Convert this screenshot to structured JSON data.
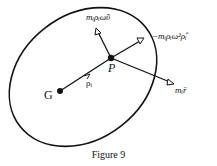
{
  "figure": {
    "caption": "Figure 9",
    "points": {
      "G": "G",
      "P": "P"
    },
    "vectors": {
      "rho": "ρᵢ",
      "tangential": "mᵢρᵢω̇ῦ",
      "centripetal": "−mᵢρᵢω²ρ̂ᵢ",
      "inertial": "mᵢr̈"
    },
    "colors": {
      "stroke": "#111111",
      "background": "#ffffff"
    }
  }
}
